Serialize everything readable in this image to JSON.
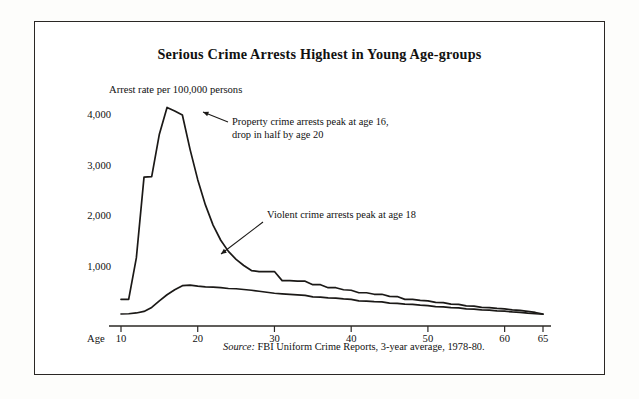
{
  "figure": {
    "title": "Serious Crime Arrests Highest in Young Age-groups",
    "source_label": "Source:",
    "source_text": " FBI Uniform Crime Reports, 3-year average, 1978-80."
  },
  "chart_data": {
    "type": "line",
    "title": "Serious Crime Arrests Highest in Young Age-groups",
    "xlabel": "Age",
    "ylabel": "Arrest rate per 100,000 persons",
    "axis_origin_label": "Age",
    "xlim": [
      10,
      65
    ],
    "ylim": [
      0,
      4300
    ],
    "grid": false,
    "legend": "none",
    "xticks": [
      10,
      20,
      30,
      40,
      50,
      60,
      65
    ],
    "xtick_labels": [
      "10",
      "20",
      "30",
      "40",
      "50",
      "60",
      "65"
    ],
    "yticks": [
      1000,
      2000,
      3000,
      4000
    ],
    "ytick_labels": [
      "1,000",
      "2,000",
      "3,000",
      "4,000"
    ],
    "x": [
      10,
      11,
      12,
      13,
      14,
      15,
      16,
      17,
      18,
      19,
      20,
      21,
      22,
      23,
      24,
      25,
      26,
      27,
      28,
      29,
      30,
      31,
      32,
      33,
      34,
      35,
      36,
      37,
      38,
      39,
      40,
      41,
      42,
      43,
      44,
      45,
      46,
      47,
      48,
      49,
      50,
      51,
      52,
      53,
      54,
      55,
      56,
      57,
      58,
      59,
      60,
      61,
      62,
      63,
      64,
      65
    ],
    "series": [
      {
        "name": "Property crime arrests",
        "values": [
          330,
          330,
          1150,
          2750,
          2760,
          3600,
          4130,
          4060,
          3980,
          3300,
          2700,
          2200,
          1800,
          1500,
          1280,
          1120,
          1000,
          900,
          880,
          880,
          880,
          700,
          700,
          690,
          690,
          620,
          620,
          560,
          560,
          520,
          510,
          460,
          460,
          430,
          430,
          390,
          385,
          330,
          330,
          310,
          300,
          270,
          265,
          235,
          230,
          200,
          195,
          170,
          165,
          150,
          140,
          120,
          110,
          90,
          70,
          40
        ]
      },
      {
        "name": "Violent crime arrests",
        "values": [
          40,
          45,
          60,
          90,
          170,
          300,
          420,
          520,
          600,
          610,
          590,
          575,
          570,
          560,
          545,
          540,
          525,
          510,
          490,
          470,
          450,
          440,
          430,
          420,
          410,
          380,
          375,
          360,
          355,
          340,
          330,
          300,
          295,
          285,
          280,
          255,
          250,
          235,
          230,
          215,
          205,
          185,
          180,
          165,
          160,
          140,
          135,
          120,
          115,
          100,
          95,
          80,
          70,
          55,
          45,
          35
        ]
      }
    ],
    "annotations": [
      {
        "id": "property-annotation",
        "lines": [
          "Property crime arrests peak at age 16,",
          "drop in half by age 20"
        ],
        "points_to_age": 16
      },
      {
        "id": "violent-annotation",
        "lines": [
          "Violent crime arrests peak at age 18"
        ],
        "points_to_age": 19
      }
    ]
  }
}
